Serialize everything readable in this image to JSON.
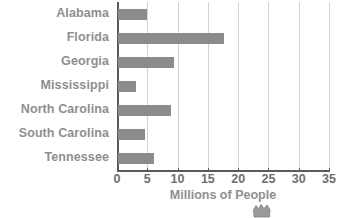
{
  "chart_data": {
    "type": "bar",
    "orientation": "horizontal",
    "title": "",
    "xlabel": "Millions of People",
    "ylabel": "",
    "categories": [
      "Alabama",
      "Florida",
      "Georgia",
      "Mississippi",
      "North Carolina",
      "South Carolina",
      "Tennessee"
    ],
    "values": [
      4.8,
      17.5,
      9.2,
      2.9,
      8.7,
      4.5,
      6.0
    ],
    "xlim": [
      0,
      35
    ],
    "xticks": [
      0,
      5,
      10,
      15,
      20,
      25,
      30,
      35
    ],
    "xtick_labels": [
      "0",
      "5",
      "10",
      "15",
      "20",
      "25",
      "30",
      "35"
    ],
    "grid": true,
    "legend": false,
    "bar_color": "#8c8c8c",
    "gridline_color": "#d3d3d3",
    "axis_color": "#5a5a5a",
    "label_color": "#8f8f8f",
    "tick_color": "#6e6e6e"
  }
}
